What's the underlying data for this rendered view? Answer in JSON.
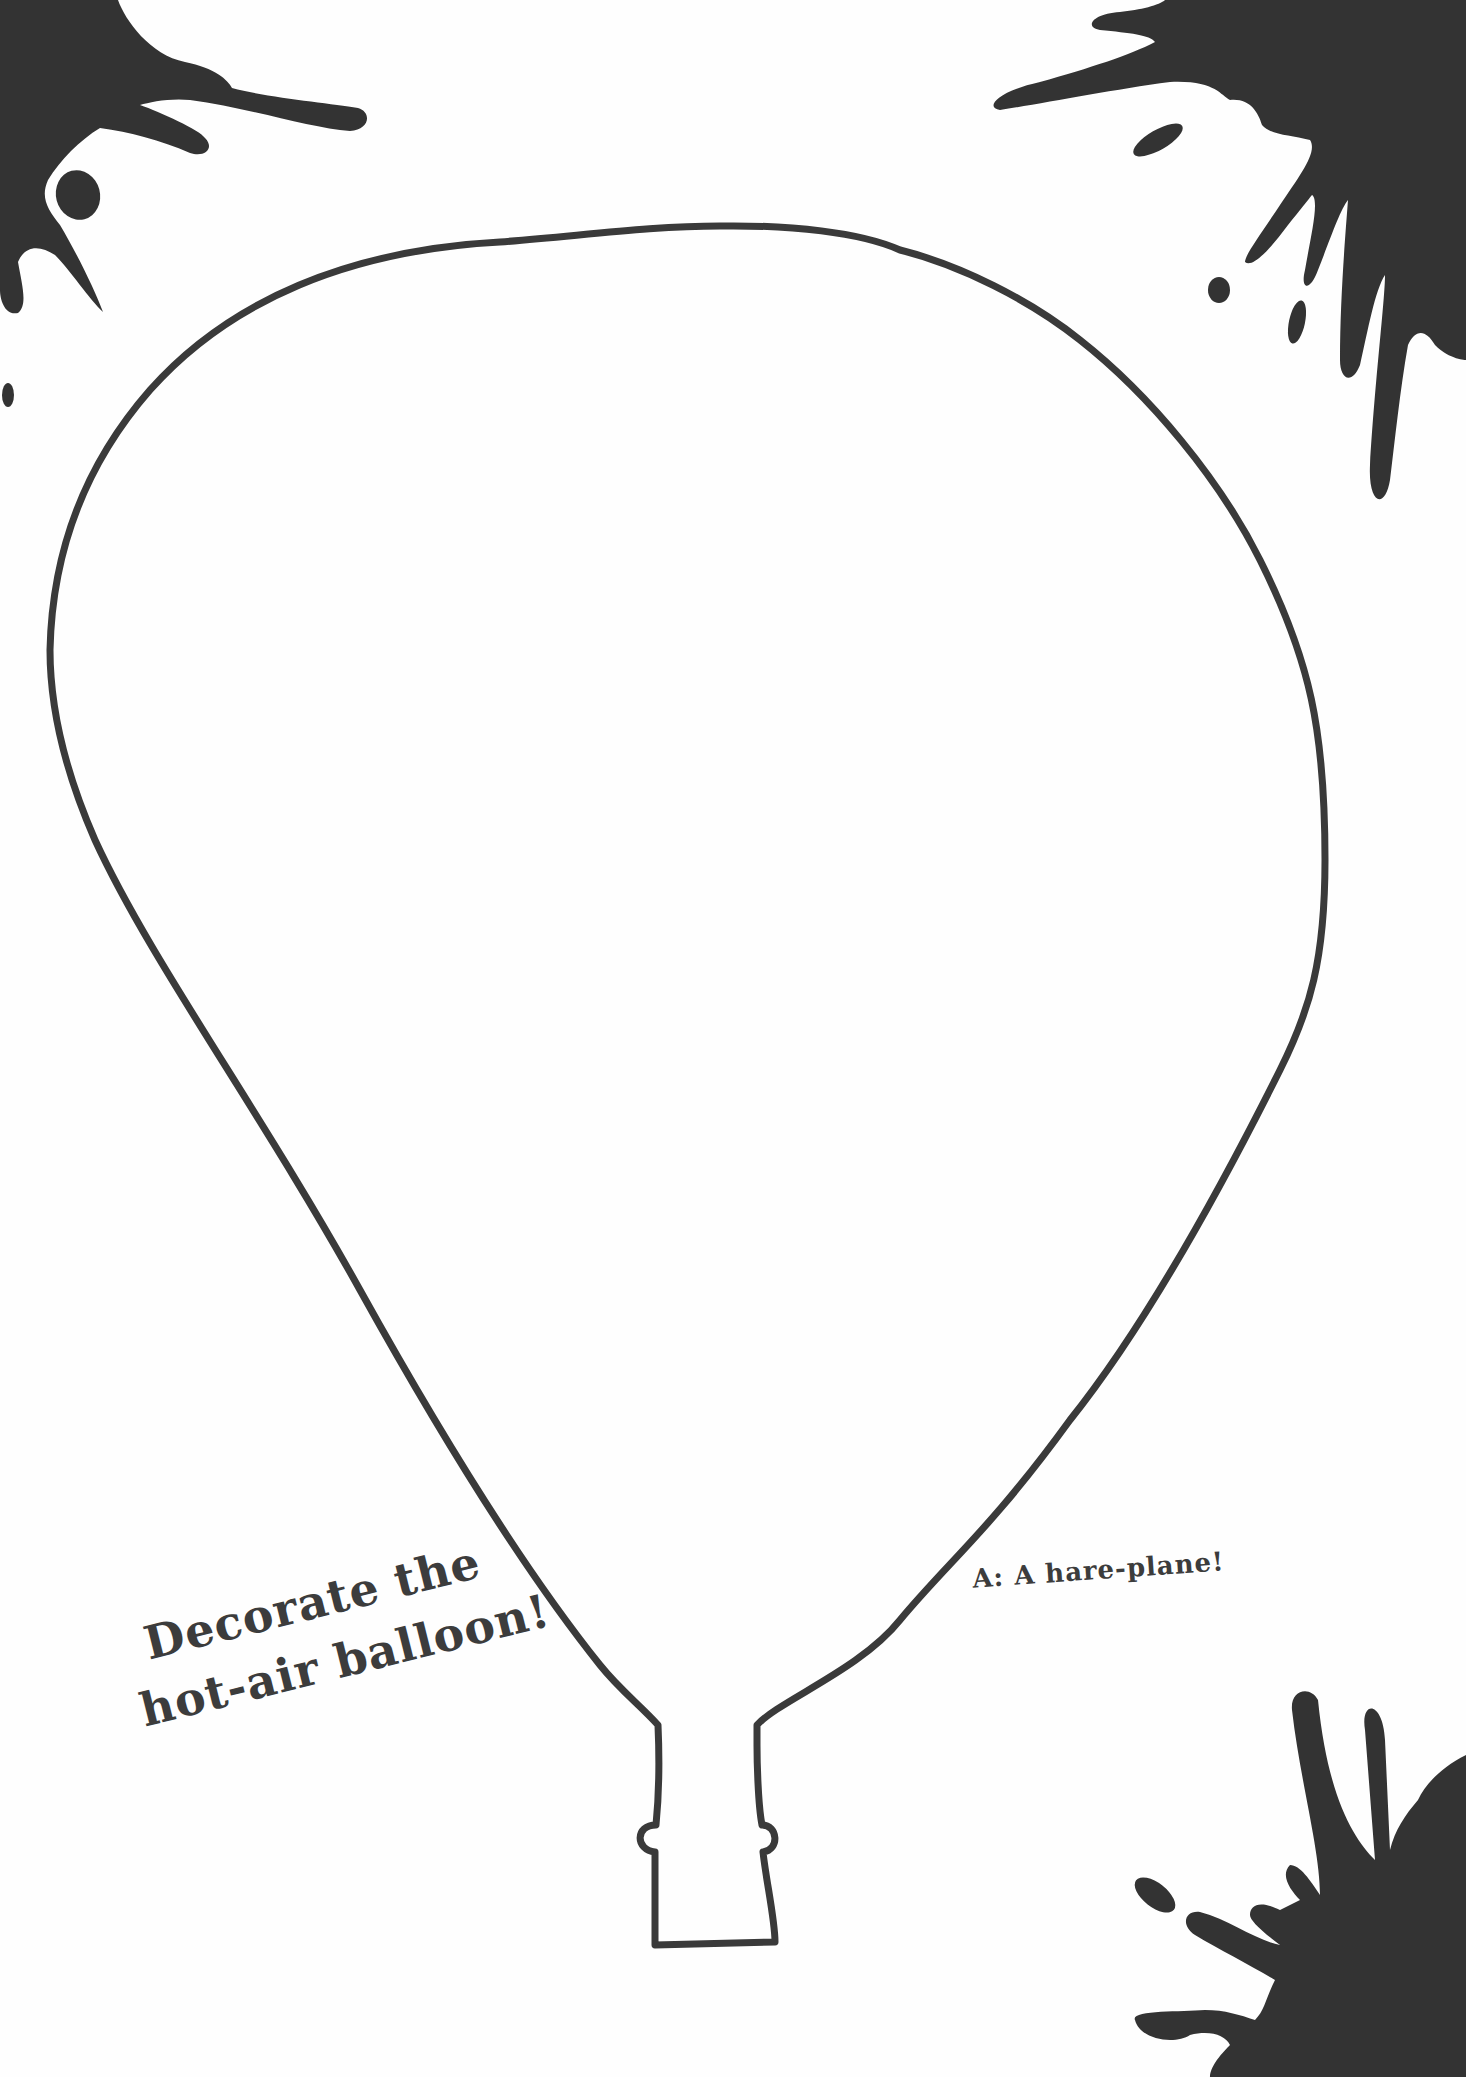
{
  "page": {
    "background": "#fefefe",
    "ink_color": "#3c3c3c"
  },
  "headline": {
    "line1": "Decorate the",
    "line2": "hot-air balloon!"
  },
  "answer": {
    "text": "A: A hare-plane!"
  },
  "decorations": {
    "balloon_outline": "hot-air-balloon-outline",
    "splats": [
      "top-left-ink-splat",
      "top-right-ink-splat",
      "bottom-right-ink-splat"
    ]
  }
}
